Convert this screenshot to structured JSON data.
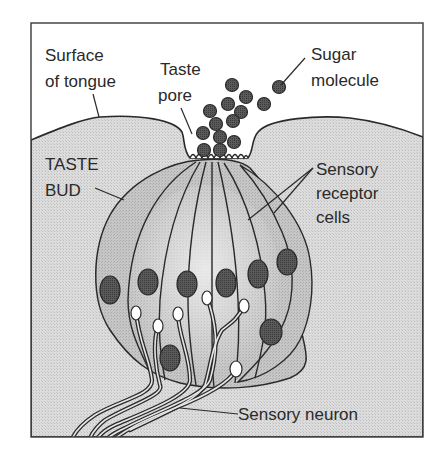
{
  "diagram": {
    "labels": {
      "surface_line1": "Surface",
      "surface_line2": "of tongue",
      "pore_line1": "Taste",
      "pore_line2": "pore",
      "sugar_line1": "Sugar",
      "sugar_line2": "molecule",
      "bud_line1": "TASTE",
      "bud_line2": "BUD",
      "receptor_line1": "Sensory",
      "receptor_line2": "receptor",
      "receptor_line3": "cells",
      "neuron": "Sensory neuron"
    },
    "colors": {
      "background": "#ffffff",
      "tissue": "#d9d9d9",
      "cell": "#c4c4c4",
      "cell_light": "#e3e3e3",
      "nucleus": "#555555",
      "molecule": "#444444",
      "outline": "#2a2a2a"
    },
    "sugar_molecule_count": 14,
    "receptor_nuclei_count": 9
  }
}
